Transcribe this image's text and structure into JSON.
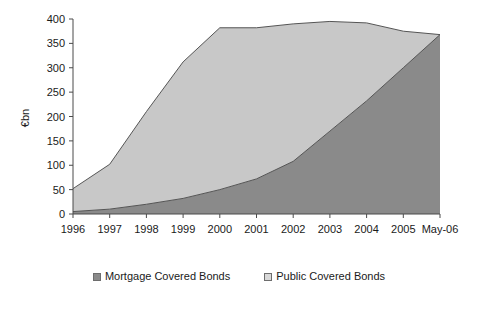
{
  "chart_data": {
    "type": "area",
    "stacked": true,
    "title": "",
    "subtitle": "",
    "xlabel": "",
    "ylabel": "€bn",
    "ylim": [
      0,
      400
    ],
    "yticks": [
      0,
      50,
      100,
      150,
      200,
      250,
      300,
      350,
      400
    ],
    "ytick_labels": [
      "0",
      "50",
      "100",
      "150",
      "200",
      "250",
      "300",
      "350",
      "400"
    ],
    "grid": false,
    "legend_position": "bottom",
    "categories": [
      "1996",
      "1997",
      "1998",
      "1999",
      "2000",
      "2001",
      "2002",
      "2003",
      "2004",
      "2005",
      "May-06"
    ],
    "series": [
      {
        "name": "Mortgage Covered Bonds",
        "color": "#8a8a8a",
        "values": [
          5,
          10,
          20,
          32,
          50,
          72,
          108,
          170,
          232,
          300,
          368
        ]
      },
      {
        "name": "Public Covered Bonds",
        "color": "#c8c8c8",
        "values": [
          47,
          92,
          190,
          280,
          332,
          310,
          282,
          225,
          160,
          75,
          0
        ]
      }
    ],
    "totals": [
      52,
      102,
      210,
      312,
      382,
      382,
      390,
      395,
      392,
      375,
      368
    ]
  },
  "axes": {
    "y_axis_title": "€bn",
    "y_tick_labels": [
      "400",
      "350",
      "300",
      "250",
      "200",
      "150",
      "100",
      "50",
      "0"
    ],
    "x_tick_labels": [
      "1996",
      "1997",
      "1998",
      "1999",
      "2000",
      "2001",
      "2002",
      "2003",
      "2004",
      "2005",
      "May-06"
    ]
  },
  "legend": {
    "items": [
      {
        "label": "Mortgage Covered Bonds",
        "color": "#8a8a8a"
      },
      {
        "label": "Public Covered Bonds",
        "color": "#d8d8d8"
      }
    ]
  }
}
